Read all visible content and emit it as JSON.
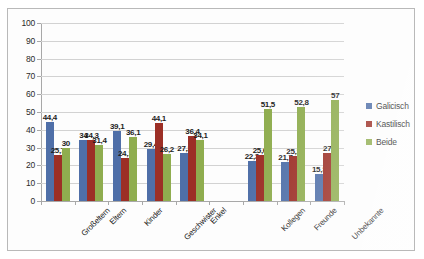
{
  "chart_data": {
    "type": "bar",
    "title": "",
    "xlabel": "",
    "ylabel": "",
    "ylim": [
      0,
      100
    ],
    "ytick_step": 10,
    "yticks": [
      100,
      90,
      80,
      70,
      60,
      50,
      40,
      30,
      20,
      10,
      0
    ],
    "grid": true,
    "legend_position": "right",
    "categories": [
      "Großeltern",
      "Eltern",
      "Kinder",
      "Geschwister",
      "Enkel",
      "",
      "Kollegen",
      "Freunde",
      "Unbekannte"
    ],
    "series": [
      {
        "name": "Galicisch",
        "color": "#4f6fa8",
        "values": [
          44.4,
          34,
          39.1,
          29.4,
          27.2,
          null,
          22.3,
          21.7,
          15.3
        ],
        "labels": [
          "44,4",
          "34",
          "39,1",
          "29,4",
          "27,2",
          "",
          "22,3",
          "21,7",
          "15,3"
        ]
      },
      {
        "name": "Kastilisch",
        "color": "#9c2f26",
        "values": [
          25.7,
          34.3,
          24.1,
          44.1,
          36.4,
          null,
          25.6,
          25.2,
          27
        ],
        "labels": [
          "25,7",
          "34,3",
          "24,1",
          "44,1",
          "36,4",
          "",
          "25,6",
          "25,2",
          "27"
        ]
      },
      {
        "name": "Beide",
        "color": "#8fad4f",
        "values": [
          30,
          31.4,
          36.1,
          26.2,
          34.1,
          null,
          51.5,
          52.8,
          57
        ],
        "labels": [
          "30",
          "31,4",
          "36,1",
          "26,2",
          "34,1",
          "",
          "51,5",
          "52,8",
          "57"
        ]
      }
    ]
  },
  "legend": {
    "items": [
      {
        "label": "Galicisch"
      },
      {
        "label": "Kastilisch"
      },
      {
        "label": "Beide"
      }
    ]
  }
}
